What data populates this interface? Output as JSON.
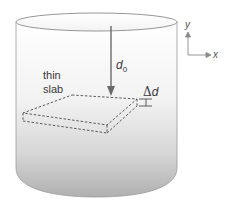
{
  "diagram": {
    "title": "",
    "labels": {
      "thin": "thin",
      "slab": "slab",
      "d0_main": "d",
      "d0_sub": "0",
      "delta_symbol": "Δ",
      "delta_var": "d"
    },
    "axes": {
      "y_label": "y",
      "x_label": "x"
    },
    "colors": {
      "container_gradient_top": "#ffffff",
      "container_gradient_bottom": "#b8b8b8",
      "outline": "#8a8a8a",
      "arrow": "#6a6a6a",
      "dashed": "#4a4a4a",
      "text": "#3a3a3a"
    }
  }
}
